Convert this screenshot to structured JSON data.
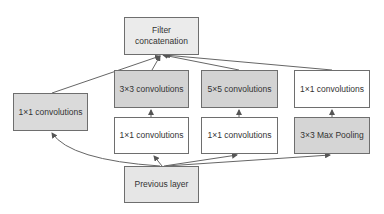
{
  "diagram": {
    "colors": {
      "concat": "#ebebeb",
      "conv_dark": "#d3d3d3",
      "conv_left": "#dadada",
      "conv_white": "#ffffff",
      "pool": "#d5d5d5",
      "prev": "#e6e6e6",
      "edge": "#555555"
    },
    "nodes": {
      "concat": {
        "line1": "Filter",
        "line2": "concatenation"
      },
      "conv3x3": {
        "label": "3×3 convolutions"
      },
      "conv5x5": {
        "label": "5×5 convolutions"
      },
      "conv1x1_pool": {
        "label": "1×1 convolutions"
      },
      "conv1x1_direct": {
        "label": "1×1 convolutions"
      },
      "conv1x1_reduce3": {
        "label": "1×1 convolutions"
      },
      "conv1x1_reduce5": {
        "label": "1×1 convolutions"
      },
      "maxpool": {
        "label": "3×3 Max Pooling"
      },
      "prev": {
        "label": "Previous layer"
      }
    },
    "edges": [
      [
        "prev",
        "conv1x1_direct"
      ],
      [
        "prev",
        "conv1x1_reduce3"
      ],
      [
        "prev",
        "conv1x1_reduce5"
      ],
      [
        "prev",
        "maxpool"
      ],
      [
        "conv1x1_reduce3",
        "conv3x3"
      ],
      [
        "conv1x1_reduce5",
        "conv5x5"
      ],
      [
        "maxpool",
        "conv1x1_pool"
      ],
      [
        "conv1x1_direct",
        "concat"
      ],
      [
        "conv3x3",
        "concat"
      ],
      [
        "conv5x5",
        "concat"
      ],
      [
        "conv1x1_pool",
        "concat"
      ]
    ]
  }
}
